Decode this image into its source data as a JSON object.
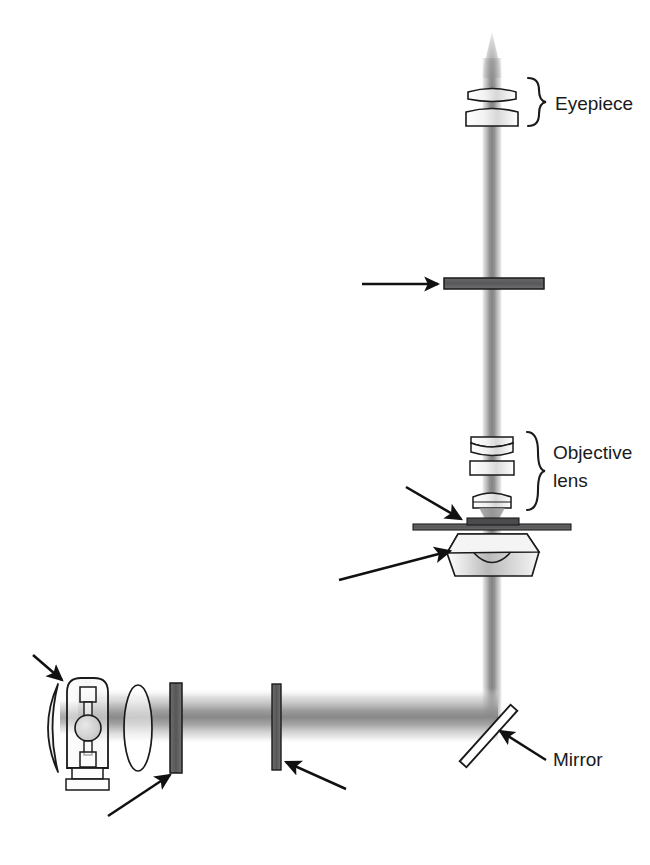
{
  "figure": {
    "type": "optical-ray-diagram",
    "background_color": "#ffffff",
    "beam_color": "#9a9a9a",
    "outline_color": "#1a1a1a",
    "component_fill": "#58585a"
  },
  "labels": {
    "eyepiece": "Eyepiece",
    "objective_line1": "Objective",
    "objective_line2": "lens",
    "mirror": "Mirror"
  },
  "components": [
    {
      "id": "eyepiece-upper-lens",
      "name": "Eyepiece upper lens element"
    },
    {
      "id": "eyepiece-lower-lens",
      "name": "Eyepiece lower lens element"
    },
    {
      "id": "upper-filter",
      "name": "Horizontal filter in imaging path"
    },
    {
      "id": "objective-lens-top",
      "name": "Objective lens upper element"
    },
    {
      "id": "objective-lens-middle",
      "name": "Objective lens middle element"
    },
    {
      "id": "objective-lens-front",
      "name": "Objective front lens element"
    },
    {
      "id": "specimen-slide",
      "name": "Specimen slide with sample"
    },
    {
      "id": "condenser",
      "name": "Condenser"
    },
    {
      "id": "mirror",
      "name": "45 degree folding mirror"
    },
    {
      "id": "field-diaphragm",
      "name": "Vertical field diaphragm"
    },
    {
      "id": "source-filter",
      "name": "Vertical filter near lamp"
    },
    {
      "id": "collector-lens",
      "name": "Collector lens"
    },
    {
      "id": "lamp-housing",
      "name": "Lamp housing with arc bulb"
    },
    {
      "id": "reflector",
      "name": "Concave rear reflector"
    }
  ],
  "callout_arrows": [
    {
      "id": "arrow-reflector",
      "points_to": "reflector",
      "direction": "down-right"
    },
    {
      "id": "arrow-source-filter",
      "points_to": "source-filter",
      "direction": "up-right"
    },
    {
      "id": "arrow-field-diaphragm",
      "points_to": "field-diaphragm",
      "direction": "up-left"
    },
    {
      "id": "arrow-condenser",
      "points_to": "condenser",
      "direction": "up-right"
    },
    {
      "id": "arrow-specimen-slide",
      "points_to": "specimen-slide",
      "direction": "down-right"
    },
    {
      "id": "arrow-upper-filter",
      "points_to": "upper-filter",
      "direction": "right"
    },
    {
      "id": "arrow-mirror",
      "points_to": "mirror",
      "direction": "up-left"
    }
  ]
}
